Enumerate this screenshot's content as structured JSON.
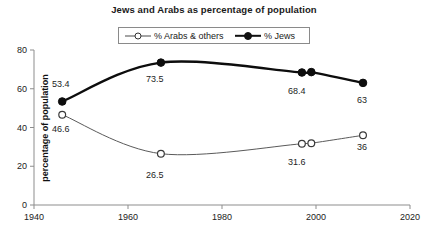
{
  "chart_data": {
    "type": "line",
    "title": "Jews and Arabs as percentage of population",
    "xlabel": "",
    "ylabel": "percentage of population",
    "xlim": [
      1940,
      2020
    ],
    "ylim": [
      0,
      80
    ],
    "xticks": [
      "1940",
      "1960",
      "1980",
      "2000",
      "2020"
    ],
    "yticks": [
      "0",
      "20",
      "40",
      "60",
      "80"
    ],
    "grid": false,
    "legend_position": "top-center",
    "x": [
      1946,
      1967,
      1997,
      1999,
      2010
    ],
    "series": [
      {
        "name": "% Arabs & others",
        "marker": "open-circle",
        "values": [
          46.6,
          26.5,
          31.6,
          31.9,
          36
        ],
        "labels": [
          "46.6",
          "26.5",
          "31.6",
          "",
          "36"
        ]
      },
      {
        "name": "% Jews",
        "marker": "filled-circle",
        "values": [
          53.4,
          73.5,
          68.4,
          68.6,
          63
        ],
        "labels": [
          "53.4",
          "73.5",
          "68.4",
          "",
          "63"
        ]
      }
    ]
  },
  "chart": {
    "title": "Jews and Arabs as percentage of population",
    "y_axis_title": "percentage of population",
    "y_ticks": [
      {
        "label": "80",
        "value": 80
      },
      {
        "label": "60",
        "value": 60
      },
      {
        "label": "40",
        "value": 40
      },
      {
        "label": "20",
        "value": 20
      },
      {
        "label": "0",
        "value": 0
      }
    ],
    "x_ticks": [
      {
        "label": "1940",
        "value": 1940
      },
      {
        "label": "1960",
        "value": 1960
      },
      {
        "label": "1980",
        "value": 1980
      },
      {
        "label": "2000",
        "value": 2000
      },
      {
        "label": "2020",
        "value": 2020
      }
    ],
    "legend": {
      "arabs_label": "% Arabs & others",
      "jews_label": "% Jews"
    },
    "point_labels": {
      "jews_1946": "53.4",
      "arabs_1946": "46.6",
      "jews_1967": "73.5",
      "arabs_1967": "26.5",
      "jews_1997": "68.4",
      "arabs_1997": "31.6",
      "jews_2010": "63",
      "arabs_2010": "36"
    },
    "colors": {
      "jews_line": "#0d0d0d",
      "arabs_line": "#5a5a5a",
      "axis": "#8d8d8d",
      "text": "#1a1a1a",
      "background": "#ffffff"
    }
  }
}
